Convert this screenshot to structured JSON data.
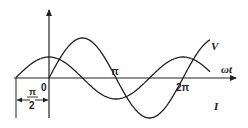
{
  "diagram": {
    "type": "phasor-waveform",
    "axes": {
      "x_label": "ωt",
      "origin_label": "0",
      "ticks": [
        "π",
        "2π"
      ]
    },
    "curves": [
      {
        "name": "V",
        "label": "V",
        "function": "sin",
        "amplitude": 1.0
      },
      {
        "name": "I",
        "label": "I",
        "function": "cos",
        "amplitude": 0.52
      }
    ],
    "phase_annotation": {
      "numerator": "π",
      "denominator": "2"
    },
    "colors": {
      "stroke": "#222222",
      "background": "#ffffff"
    }
  },
  "geometry": {
    "origin_x": 49,
    "origin_y": 78,
    "pi_px": 67,
    "v_amp": 40,
    "i_amp": 21,
    "x_start": 16,
    "x_end": 210
  }
}
